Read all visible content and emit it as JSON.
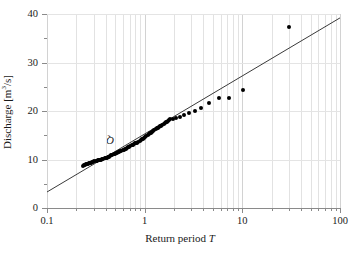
{
  "chart_data": {
    "type": "scatter",
    "title": "",
    "xlabel": "Return period T",
    "xlabel_parts": {
      "text": "Return period ",
      "italic": "T"
    },
    "ylabel": "Discharge Q [m³/s]",
    "ylabel_parts": {
      "pre": "Discharge ",
      "italic": "Q",
      "post": " [m",
      "sup": "3",
      "post2": "/s]"
    },
    "xscale": "log",
    "yscale": "linear",
    "xlim": [
      0.1,
      100
    ],
    "ylim": [
      0,
      40
    ],
    "grid": true,
    "legend": null,
    "xticks": [
      0.1,
      1,
      10,
      100
    ],
    "xticklabels": [
      "0.1",
      "1",
      "10",
      "100"
    ],
    "xminorticks": [
      0.2,
      0.3,
      0.4,
      0.5,
      0.6,
      0.7,
      0.8,
      0.9,
      2,
      3,
      4,
      5,
      6,
      7,
      8,
      9,
      20,
      30,
      40,
      50,
      60,
      70,
      80,
      90
    ],
    "yticks": [
      0,
      10,
      20,
      30,
      40
    ],
    "yticklabels": [
      "0",
      "10",
      "20",
      "30",
      "40"
    ],
    "yminorticks": [
      5,
      15,
      25,
      35
    ],
    "series": [
      {
        "name": "observations",
        "marker": "filled-circle",
        "color": "#000000",
        "points": [
          [
            0.232,
            8.7
          ],
          [
            0.238,
            8.8
          ],
          [
            0.244,
            8.9
          ],
          [
            0.25,
            9.0
          ],
          [
            0.256,
            9.0
          ],
          [
            0.262,
            9.1
          ],
          [
            0.269,
            9.2
          ],
          [
            0.276,
            9.3
          ],
          [
            0.283,
            9.3
          ],
          [
            0.29,
            9.4
          ],
          [
            0.298,
            9.5
          ],
          [
            0.306,
            9.6
          ],
          [
            0.314,
            9.6
          ],
          [
            0.322,
            9.7
          ],
          [
            0.331,
            9.8
          ],
          [
            0.34,
            9.9
          ],
          [
            0.349,
            10.0
          ],
          [
            0.358,
            10.0
          ],
          [
            0.368,
            10.1
          ],
          [
            0.378,
            10.2
          ],
          [
            0.388,
            10.3
          ],
          [
            0.398,
            10.4
          ],
          [
            0.409,
            10.4
          ],
          [
            0.42,
            10.5
          ],
          [
            0.431,
            10.6
          ],
          [
            0.443,
            10.8
          ],
          [
            0.455,
            10.9
          ],
          [
            0.467,
            11.0
          ],
          [
            0.48,
            11.1
          ],
          [
            0.493,
            11.2
          ],
          [
            0.506,
            11.3
          ],
          [
            0.52,
            11.4
          ],
          [
            0.534,
            11.5
          ],
          [
            0.548,
            11.6
          ],
          [
            0.563,
            11.7
          ],
          [
            0.578,
            11.8
          ],
          [
            0.594,
            11.9
          ],
          [
            0.61,
            12.0
          ],
          [
            0.626,
            12.1
          ],
          [
            0.643,
            12.2
          ],
          [
            0.661,
            12.4
          ],
          [
            0.679,
            12.5
          ],
          [
            0.697,
            12.6
          ],
          [
            0.716,
            12.8
          ],
          [
            0.736,
            12.9
          ],
          [
            0.756,
            13.0
          ],
          [
            0.776,
            13.1
          ],
          [
            0.797,
            13.3
          ],
          [
            0.819,
            13.4
          ],
          [
            0.841,
            13.5
          ],
          [
            0.864,
            13.7
          ],
          [
            0.887,
            13.8
          ],
          [
            0.911,
            14.0
          ],
          [
            0.936,
            14.2
          ],
          [
            0.961,
            14.3
          ],
          [
            0.988,
            14.5
          ],
          [
            1.015,
            14.7
          ],
          [
            1.042,
            14.9
          ],
          [
            1.07,
            15.0
          ],
          [
            1.099,
            15.2
          ],
          [
            1.129,
            15.4
          ],
          [
            1.16,
            15.5
          ],
          [
            1.191,
            15.7
          ],
          [
            1.224,
            15.9
          ],
          [
            1.257,
            16.1
          ],
          [
            1.291,
            16.2
          ],
          [
            1.327,
            16.4
          ],
          [
            1.363,
            16.5
          ],
          [
            1.4,
            16.7
          ],
          [
            1.438,
            16.9
          ],
          [
            1.477,
            17.0
          ],
          [
            1.518,
            17.2
          ],
          [
            1.559,
            17.3
          ],
          [
            1.602,
            17.5
          ],
          [
            1.646,
            17.7
          ],
          [
            1.691,
            17.8
          ],
          [
            1.737,
            18.0
          ],
          [
            1.784,
            18.2
          ],
          [
            1.833,
            18.4
          ],
          [
            1.95,
            18.3
          ],
          [
            2.1,
            18.5
          ],
          [
            2.3,
            18.7
          ],
          [
            2.55,
            19.1
          ],
          [
            2.85,
            19.6
          ],
          [
            3.25,
            19.9
          ],
          [
            3.8,
            20.6
          ],
          [
            4.6,
            21.7
          ],
          [
            5.8,
            22.6
          ],
          [
            7.3,
            22.6
          ],
          [
            10.2,
            24.4
          ],
          [
            30.0,
            37.3
          ]
        ]
      }
    ],
    "fit_line": {
      "name": "log-linear fit",
      "color": "#3a3a3a",
      "x_start": 0.1,
      "y_start": 3.3,
      "x_end": 100.0,
      "y_end": 39.2
    }
  }
}
